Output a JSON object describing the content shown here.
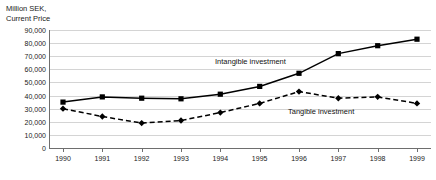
{
  "chart_data": {
    "type": "line",
    "title": "",
    "ylabel": "Million SEK,\nCurrent Price",
    "xlabel": "",
    "categories": [
      "1990",
      "1991",
      "1992",
      "1993",
      "1994",
      "1995",
      "1996",
      "1997",
      "1998",
      "1999"
    ],
    "ylim": [
      0,
      90000
    ],
    "ytick_labels": [
      "90,000",
      "80,000",
      "70,000",
      "60,000",
      "50,000",
      "40,000",
      "30,000",
      "20,000",
      "10,000",
      "0"
    ],
    "ytick_values": [
      90000,
      80000,
      70000,
      60000,
      50000,
      40000,
      30000,
      20000,
      10000,
      0
    ],
    "grid": true,
    "legend_position": "inline-annotation",
    "series": [
      {
        "name": "Intangible investment",
        "marker": "square",
        "line_style": "solid",
        "color": "#000000",
        "values": [
          35000,
          39000,
          38000,
          37500,
          41000,
          47000,
          57000,
          72000,
          78000,
          83000
        ]
      },
      {
        "name": "Tangible investment",
        "marker": "diamond",
        "line_style": "dashed",
        "color": "#000000",
        "values": [
          30000,
          24000,
          19000,
          21000,
          27000,
          34000,
          43000,
          38000,
          39000,
          34000
        ]
      }
    ]
  }
}
